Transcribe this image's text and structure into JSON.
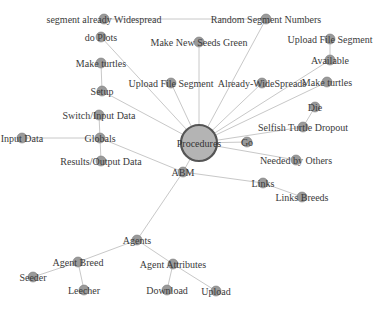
{
  "diagram": {
    "type": "network-graph",
    "root": "Procedures",
    "colors": {
      "edge": "#c8c8c8",
      "node_fill": "#9a9a9a",
      "root_fill": "#b4b4b4",
      "root_stroke": "#555555",
      "label": "#3a3a3a"
    },
    "nodes": [
      {
        "id": "procedures",
        "label": "Procedures",
        "x": 199,
        "y": 143,
        "r": 18,
        "main": true
      },
      {
        "id": "seg_widespread",
        "label": "segment already Widespread",
        "x": 104,
        "y": 19,
        "r": 5
      },
      {
        "id": "random_seg",
        "label": "Random Segment Numbers",
        "x": 266,
        "y": 19,
        "r": 5
      },
      {
        "id": "do_plots",
        "label": "do Plots",
        "x": 101,
        "y": 37,
        "r": 5
      },
      {
        "id": "seeds_green",
        "label": "Make New Seeds Green",
        "x": 199,
        "y": 42,
        "r": 5
      },
      {
        "id": "upload_seg_r",
        "label": "Upload File Segment",
        "x": 330,
        "y": 39,
        "r": 5
      },
      {
        "id": "available",
        "label": "Available",
        "x": 330,
        "y": 60,
        "r": 5
      },
      {
        "id": "make_turtles_l",
        "label": "Make turtles",
        "x": 101,
        "y": 63,
        "r": 5
      },
      {
        "id": "upload_seg_c",
        "label": "Upload File Segment",
        "x": 171,
        "y": 83,
        "r": 5
      },
      {
        "id": "already_ws",
        "label": "Already-WideSpreads",
        "x": 262,
        "y": 83,
        "r": 5
      },
      {
        "id": "make_turtles_r",
        "label": "Make turtles",
        "x": 327,
        "y": 82,
        "r": 5
      },
      {
        "id": "setup",
        "label": "Setup",
        "x": 102,
        "y": 91,
        "r": 5
      },
      {
        "id": "die",
        "label": "Die",
        "x": 315,
        "y": 107,
        "r": 5
      },
      {
        "id": "switch_input",
        "label": "Switch/Input Data",
        "x": 99,
        "y": 115,
        "r": 5
      },
      {
        "id": "selfish",
        "label": "Selfish Turtle Dropout",
        "x": 303,
        "y": 127,
        "r": 5
      },
      {
        "id": "input_data",
        "label": "Input Data",
        "x": 22,
        "y": 138,
        "r": 5
      },
      {
        "id": "globals",
        "label": "Globals",
        "x": 100,
        "y": 138,
        "r": 5
      },
      {
        "id": "go",
        "label": "Go",
        "x": 247,
        "y": 142,
        "r": 5
      },
      {
        "id": "results_output",
        "label": "Results/Output Data",
        "x": 101,
        "y": 161,
        "r": 5
      },
      {
        "id": "needed_by",
        "label": "Needed by Others",
        "x": 296,
        "y": 160,
        "r": 5
      },
      {
        "id": "abm",
        "label": "ABM",
        "x": 183,
        "y": 172,
        "r": 5
      },
      {
        "id": "links",
        "label": "Links",
        "x": 263,
        "y": 183,
        "r": 5
      },
      {
        "id": "links_breeds",
        "label": "Links Breeds",
        "x": 302,
        "y": 197,
        "r": 5
      },
      {
        "id": "agents",
        "label": "Agents",
        "x": 137,
        "y": 240,
        "r": 5
      },
      {
        "id": "agent_breed",
        "label": "Agent Breed",
        "x": 78,
        "y": 262,
        "r": 5
      },
      {
        "id": "agent_attr",
        "label": "Agent Attributes",
        "x": 173,
        "y": 264,
        "r": 5
      },
      {
        "id": "seeder",
        "label": "Seeder",
        "x": 33,
        "y": 277,
        "r": 5
      },
      {
        "id": "leecher",
        "label": "Leecher",
        "x": 84,
        "y": 290,
        "r": 5
      },
      {
        "id": "download",
        "label": "Download",
        "x": 167,
        "y": 290,
        "r": 5
      },
      {
        "id": "upload",
        "label": "Upload",
        "x": 216,
        "y": 291,
        "r": 5
      }
    ],
    "edges": [
      [
        "seg_widespread",
        "random_seg"
      ],
      [
        "do_plots",
        "procedures"
      ],
      [
        "seeds_green",
        "procedures"
      ],
      [
        "random_seg",
        "procedures"
      ],
      [
        "upload_seg_r",
        "available"
      ],
      [
        "available",
        "procedures"
      ],
      [
        "make_turtles_l",
        "setup"
      ],
      [
        "upload_seg_c",
        "procedures"
      ],
      [
        "already_ws",
        "procedures"
      ],
      [
        "make_turtles_r",
        "procedures"
      ],
      [
        "setup",
        "procedures"
      ],
      [
        "die",
        "selfish"
      ],
      [
        "selfish",
        "procedures"
      ],
      [
        "switch_input",
        "globals"
      ],
      [
        "input_data",
        "globals"
      ],
      [
        "globals",
        "results_output"
      ],
      [
        "globals",
        "abm"
      ],
      [
        "go",
        "procedures"
      ],
      [
        "needed_by",
        "procedures"
      ],
      [
        "procedures",
        "abm"
      ],
      [
        "abm",
        "links"
      ],
      [
        "links",
        "links_breeds"
      ],
      [
        "abm",
        "agents"
      ],
      [
        "agents",
        "agent_breed"
      ],
      [
        "agents",
        "agent_attr"
      ],
      [
        "agent_breed",
        "seeder"
      ],
      [
        "agent_breed",
        "leecher"
      ],
      [
        "agent_attr",
        "download"
      ],
      [
        "agent_attr",
        "upload"
      ]
    ]
  }
}
